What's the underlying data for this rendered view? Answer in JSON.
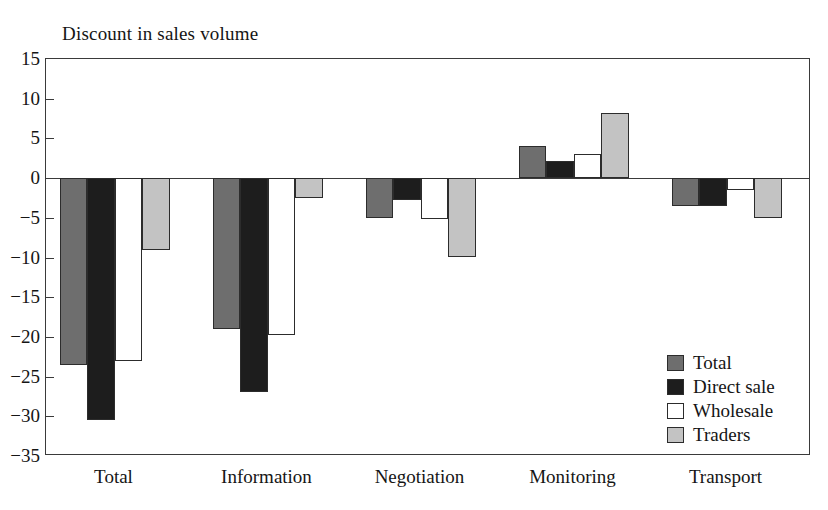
{
  "chart_data": {
    "type": "bar",
    "title": "Discount in sales volume",
    "xlabel": "",
    "ylabel": "",
    "ylim": [
      -35,
      15
    ],
    "ytick_step": 5,
    "yticks": [
      15,
      10,
      5,
      0,
      -5,
      -10,
      -15,
      -20,
      -25,
      -30,
      -35
    ],
    "ytick_labels": [
      "15",
      "10",
      "5",
      "0",
      "−5",
      "−10",
      "−15",
      "−20",
      "−25",
      "−30",
      "−35"
    ],
    "grid": false,
    "legend_position": "inside-bottom-right",
    "categories": [
      "Total",
      "Information",
      "Negotiation",
      "Monitoring",
      "Transport"
    ],
    "series": [
      {
        "name": "Total",
        "color": "#6e6e6e",
        "values": [
          -23.5,
          -19.0,
          -5.0,
          4.0,
          -3.5
        ]
      },
      {
        "name": "Direct sale",
        "color": "#1d1d1d",
        "values": [
          -30.5,
          -27.0,
          -2.8,
          2.2,
          -3.5
        ]
      },
      {
        "name": "Wholesale",
        "color": "#ffffff",
        "values": [
          -23.0,
          -19.7,
          -5.2,
          3.0,
          -1.5
        ]
      },
      {
        "name": "Traders",
        "color": "#c3c3c3",
        "values": [
          -9.0,
          -2.5,
          -10.0,
          8.2,
          -5.0
        ]
      }
    ]
  },
  "legend": {
    "entries": [
      {
        "label": "Total"
      },
      {
        "label": "Direct sale"
      },
      {
        "label": "Wholesale"
      },
      {
        "label": "Traders"
      }
    ]
  }
}
